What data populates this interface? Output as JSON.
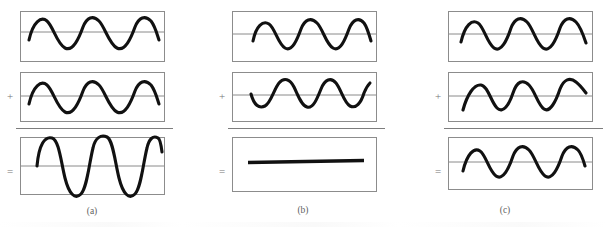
{
  "figure": {
    "panel_count": 3,
    "background_color": "#ffffff",
    "wave_color": "#111111",
    "axis_color": "#8a8a8a",
    "box_border_color": "#8c8c8c",
    "symbol_color": "#777777"
  },
  "panels": [
    {
      "id": "panel-a",
      "caption": "(a)",
      "interference_type": "constructive",
      "plus_symbol": "+",
      "equals_symbol": "=",
      "rows": [
        {
          "role": "input-wave-1",
          "symbol": "",
          "wave": {
            "shape": "sine",
            "cycles": 3,
            "amplitude": 1,
            "phase_deg": 0,
            "inverted": false,
            "flat": false
          }
        },
        {
          "role": "input-wave-2",
          "symbol": "+",
          "wave": {
            "shape": "sine",
            "cycles": 3,
            "amplitude": 1,
            "phase_deg": 0,
            "inverted": false,
            "flat": false
          }
        },
        {
          "role": "result-wave",
          "symbol": "=",
          "wave": {
            "shape": "sine",
            "cycles": 3,
            "amplitude": 2,
            "phase_deg": 0,
            "inverted": false,
            "flat": false
          }
        }
      ]
    },
    {
      "id": "panel-b",
      "caption": "(b)",
      "interference_type": "destructive",
      "plus_symbol": "+",
      "equals_symbol": "=",
      "rows": [
        {
          "role": "input-wave-1",
          "symbol": "",
          "wave": {
            "shape": "sine",
            "cycles": 3,
            "amplitude": 1,
            "phase_deg": 0,
            "inverted": false,
            "flat": false
          }
        },
        {
          "role": "input-wave-2",
          "symbol": "+",
          "wave": {
            "shape": "sine",
            "cycles": 3,
            "amplitude": 1,
            "phase_deg": 180,
            "inverted": true,
            "flat": false
          }
        },
        {
          "role": "result-wave",
          "symbol": "=",
          "wave": {
            "shape": "flat-line",
            "cycles": 0,
            "amplitude": 0,
            "phase_deg": 0,
            "inverted": false,
            "flat": true
          }
        }
      ]
    },
    {
      "id": "panel-c",
      "caption": "(c)",
      "interference_type": "partial",
      "plus_symbol": "+",
      "equals_symbol": "=",
      "rows": [
        {
          "role": "input-wave-1",
          "symbol": "",
          "wave": {
            "shape": "sine",
            "cycles": 3,
            "amplitude": 1,
            "phase_deg": 0,
            "inverted": false,
            "flat": false
          }
        },
        {
          "role": "input-wave-2",
          "symbol": "+",
          "wave": {
            "shape": "sine",
            "cycles": 3,
            "amplitude": 1,
            "phase_deg": 60,
            "inverted": false,
            "flat": false
          }
        },
        {
          "role": "result-wave",
          "symbol": "=",
          "wave": {
            "shape": "sine",
            "cycles": 3,
            "amplitude": 1.15,
            "phase_deg": 30,
            "inverted": false,
            "flat": false
          }
        }
      ]
    }
  ]
}
